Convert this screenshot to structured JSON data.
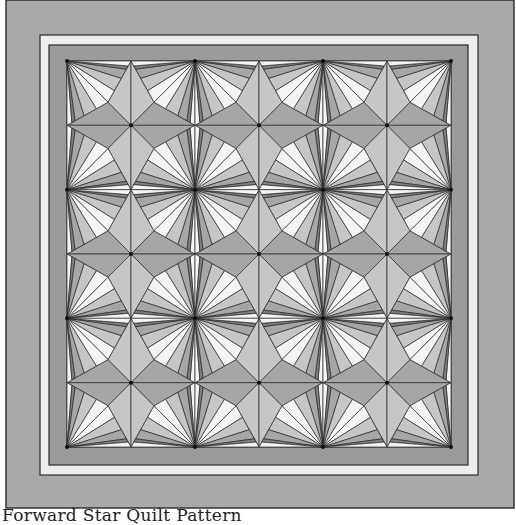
{
  "caption": "Forward Star Quilt Pattern",
  "quilt": {
    "name": "star-and-fan-quilt",
    "grid_cols": 6,
    "grid_rows": 6,
    "colors": {
      "outer_border": "#a9a9a9",
      "outline": "#2a2a2a",
      "light_strip": "#ededed",
      "inner_border": "#9b9b9b",
      "white": "#f4f4f4",
      "light_gray": "#c6c6c6",
      "mid_gray": "#a6a6a6",
      "dark_gray": "#7e7e7e",
      "darkest": "#5e5e5e"
    },
    "frame": {
      "outer": [
        6,
        0,
        508,
        508
      ],
      "light_strip": [
        40,
        35,
        438,
        440
      ],
      "inner_border": [
        49,
        45,
        419,
        420
      ],
      "pieced": [
        67,
        61,
        384,
        386
      ]
    }
  }
}
